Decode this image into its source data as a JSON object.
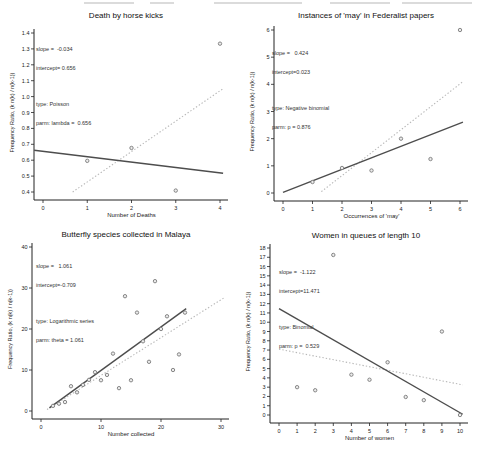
{
  "figure": {
    "background": "#ffffff",
    "description_note": ""
  },
  "colors": {
    "axis": "#222222",
    "tick_text": "#222222",
    "point_stroke": "#7a7a7a",
    "point_fill": "#ececec",
    "fit_line": "#4d4d4d",
    "ref_line": "#b8b8b8",
    "label_text": "#222222"
  },
  "chart_data": [
    {
      "type": "scatter",
      "title": "Death by horse kicks",
      "xlabel": "Number of Deaths",
      "ylabel": "Frequency Ratio, (k n(k) / n(k-1))",
      "annotation": {
        "line1": "slope =  -0.034",
        "line2": "intercept= 0.656",
        "line3": "type: Poisson",
        "line4": "parm: lambda =  0.656"
      },
      "xlim": [
        0,
        4
      ],
      "ylim": [
        0.4,
        1.4
      ],
      "x_ticks": [
        "0",
        "1",
        "2",
        "3",
        "4"
      ],
      "y_ticks": [
        "0.4",
        "0.5",
        "0.6",
        "0.7",
        "0.8",
        "0.9",
        "1.0",
        "1.1",
        "1.2",
        "1.3",
        "1.4"
      ],
      "points": [
        [
          1,
          0.596
        ],
        [
          2,
          0.677
        ],
        [
          3,
          0.409
        ],
        [
          4,
          1.333
        ]
      ],
      "fit_line": {
        "slope": -0.034,
        "intercept": 0.656,
        "x_range": [
          -0.2,
          4.07
        ]
      },
      "ref_line": {
        "x1": 0.67,
        "y1": 0.4,
        "x2": 4.07,
        "y2": 1.05
      },
      "grid": false,
      "legend": "none"
    },
    {
      "type": "scatter",
      "title": "Instances of 'may' in Federalist papers",
      "xlabel": "Occurrences of 'may'",
      "ylabel": "Frequency Ratio, (k n(k) / n(k-1))",
      "annotation": {
        "line1": "slope =   0.424",
        "line2": "intercept=0.023",
        "line3": "type: Negative binomial",
        "line4": "parm: p = 0.876"
      },
      "xlim": [
        0,
        6
      ],
      "ylim": [
        0,
        6
      ],
      "x_ticks": [
        "0",
        "1",
        "2",
        "3",
        "4",
        "5",
        "6"
      ],
      "y_ticks": [
        "0",
        "1",
        "2",
        "3",
        "4",
        "5",
        "6"
      ],
      "points": [
        [
          1,
          0.404
        ],
        [
          2,
          0.921
        ],
        [
          3,
          0.828
        ],
        [
          4,
          2.0
        ],
        [
          5,
          1.25
        ],
        [
          6,
          6.0
        ]
      ],
      "fit_line": {
        "slope": 0.424,
        "intercept": 0.023,
        "x_range": [
          0,
          6.1
        ]
      },
      "ref_line": {
        "x1": 1.3,
        "y1": 0.05,
        "x2": 6.1,
        "y2": 4.1
      },
      "grid": false,
      "legend": "none"
    },
    {
      "type": "scatter",
      "title": "Butterfly species collected in Malaya",
      "xlabel": "Number collected",
      "ylabel": "Frequency Ratio, (k n(k) / n(k-1))",
      "annotation": {
        "line1": "slope =   1.061",
        "line2": "intercept=-0.709",
        "line3": "type: Logarithmic series",
        "line4": "parm: theta = 1.061"
      },
      "xlim": [
        0,
        30
      ],
      "ylim": [
        0,
        40
      ],
      "x_ticks": [
        "0",
        "10",
        "20",
        "30"
      ],
      "y_ticks": [
        "0",
        "10",
        "20",
        "30",
        "40"
      ],
      "points": [
        [
          2,
          1.254
        ],
        [
          3,
          1.784
        ],
        [
          4,
          2.182
        ],
        [
          5,
          6.042
        ],
        [
          6,
          4.552
        ],
        [
          7,
          6.364
        ],
        [
          8,
          7.6
        ],
        [
          9,
          9.474
        ],
        [
          10,
          7.5
        ],
        [
          11,
          8.8
        ],
        [
          12,
          14.0
        ],
        [
          13,
          5.571
        ],
        [
          14,
          28.0
        ],
        [
          15,
          7.5
        ],
        [
          16,
          24.0
        ],
        [
          17,
          17.0
        ],
        [
          18,
          12.0
        ],
        [
          19,
          31.667
        ],
        [
          20,
          20.0
        ],
        [
          21,
          23.1
        ],
        [
          22,
          10.0
        ],
        [
          23,
          13.8
        ],
        [
          24,
          24.0
        ]
      ],
      "fit_line": {
        "slope": 1.061,
        "intercept": -0.709,
        "x_range": [
          1.4,
          24.2
        ]
      },
      "ref_line": {
        "x1": 1.0,
        "y1": 0.35,
        "x2": 30.5,
        "y2": 27.6
      },
      "grid": false,
      "legend": "none"
    },
    {
      "type": "scatter",
      "title": "Women in queues of length 10",
      "xlabel": "Number of women",
      "ylabel": "Frequency Ratio, (k n(k) / n(k-1))",
      "annotation": {
        "line1": "slope =  -1.122",
        "line2": "intercept=11.471",
        "line3": "type: Binomial",
        "line4": "parm: p =  0.529"
      },
      "xlim": [
        0,
        10
      ],
      "ylim": [
        0,
        18
      ],
      "x_ticks": [
        "0",
        "1",
        "2",
        "3",
        "4",
        "5",
        "6",
        "7",
        "8",
        "9",
        "10"
      ],
      "y_ticks": [
        "0",
        "1",
        "2",
        "3",
        "4",
        "5",
        "6",
        "7",
        "8",
        "9",
        "10",
        "11",
        "12",
        "13",
        "14",
        "15",
        "16",
        "17",
        "18"
      ],
      "points": [
        [
          1,
          3.0
        ],
        [
          2,
          2.667
        ],
        [
          3,
          17.25
        ],
        [
          4,
          4.348
        ],
        [
          5,
          3.8
        ],
        [
          6,
          5.684
        ],
        [
          7,
          1.944
        ],
        [
          8,
          1.6
        ],
        [
          9,
          9.0
        ],
        [
          10,
          0.0
        ]
      ],
      "fit_line": {
        "slope": -1.122,
        "intercept": 11.471,
        "x_range": [
          0,
          10.15
        ]
      },
      "ref_line": {
        "x1": 0,
        "y1": 7.1,
        "x2": 10.15,
        "y2": 3.25
      },
      "grid": false,
      "legend": "none"
    }
  ]
}
